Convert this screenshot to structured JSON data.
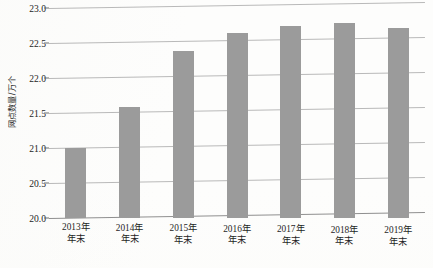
{
  "chart_data": {
    "type": "bar",
    "title": "",
    "xlabel": "",
    "ylabel": "网点数量/万个",
    "categories": [
      "2013年\n年末",
      "2014年\n年末",
      "2015年\n年末",
      "2016年\n年末",
      "2017年\n年末",
      "2018年\n年末",
      "2019年\n年末"
    ],
    "category_lines": [
      [
        "2013年",
        "年末"
      ],
      [
        "2014年",
        "年末"
      ],
      [
        "2015年",
        "年末"
      ],
      [
        "2016年",
        "年末"
      ],
      [
        "2017年",
        "年末"
      ],
      [
        "2018年",
        "年末"
      ],
      [
        "2019年",
        "年末"
      ]
    ],
    "values": [
      21.0,
      21.58,
      22.39,
      22.65,
      22.74,
      22.79,
      22.71
    ],
    "ylim": [
      20.0,
      23.0
    ],
    "yticks": [
      20.0,
      20.5,
      21.0,
      21.5,
      22.0,
      22.5,
      23.0
    ],
    "ytick_labels": [
      "20.0",
      "20.5",
      "21.0",
      "21.5",
      "22.0",
      "22.5",
      "23.0"
    ],
    "grid": true,
    "legend": "none",
    "bar_color": "#9b9b9b",
    "gridline_color": "#b9b9b9",
    "background_color": "#fdfdfc"
  }
}
